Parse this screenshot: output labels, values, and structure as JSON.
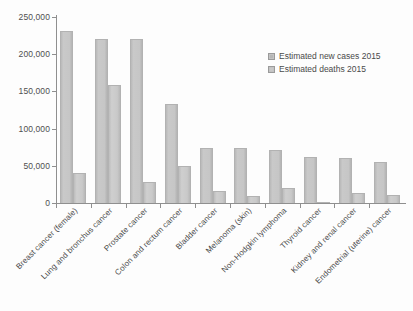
{
  "chart_data": {
    "type": "bar",
    "title": "",
    "subtitle": "",
    "xlabel": "",
    "ylabel": "",
    "ylim": [
      0,
      250000
    ],
    "grid": false,
    "legend_position": "top-right",
    "y_ticks": [
      "0",
      "50,000",
      "100,000",
      "150,000",
      "200,000",
      "250,000"
    ],
    "y_tick_values": [
      0,
      50000,
      100000,
      150000,
      200000,
      250000
    ],
    "categories": [
      "Breast cancer (female)",
      "Lung and bronchus cancer",
      "Prostate cancer",
      "Colon and rectum cancer",
      "Bladder cancer",
      "Melanoma (skin)",
      "Non-Hodgkin lymphoma",
      "Thyroid cancer",
      "Kidney and renal cancer",
      "Endometrial (uterine) cancer"
    ],
    "series": [
      {
        "name": "Estimated new cases 2015",
        "values": [
          231000,
          221000,
          220000,
          133000,
          74000,
          74000,
          71000,
          62000,
          61000,
          55000
        ]
      },
      {
        "name": "Estimated deaths 2015",
        "values": [
          40000,
          158000,
          28000,
          50000,
          16000,
          10000,
          20000,
          2000,
          14000,
          11000
        ]
      }
    ]
  },
  "legend": {
    "items": [
      {
        "label": "Estimated new cases 2015"
      },
      {
        "label": "Estimated deaths 2015"
      }
    ]
  },
  "colors": {
    "bar_new_cases": "#c3c3c3",
    "bar_deaths": "#c9c9c9",
    "axis": "#8f8f8f",
    "text": "#4a4a4a",
    "background": "#fdfdfd"
  }
}
